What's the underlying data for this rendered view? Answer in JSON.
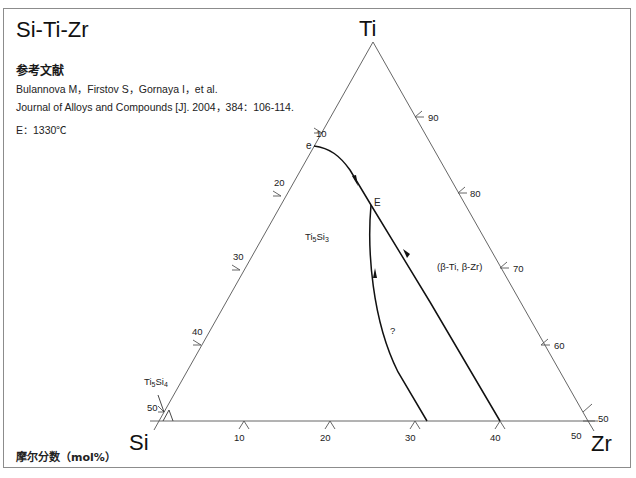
{
  "header": {
    "title": "Si-Ti-Zr",
    "reference_heading": "参考文献",
    "reference_authors": "Bulannova M，Firstov S，Gornaya I，et al.",
    "reference_journal": "Journal of Alloys and Compounds [J]. 2004，384：106-114.",
    "condition": "E：1330℃"
  },
  "footer": {
    "unit_label": "摩尔分数（mol%）"
  },
  "diagram": {
    "type": "partial-ternary-liquidus-projection",
    "corners": {
      "top": "Ti",
      "left": "Si",
      "right": "Zr"
    },
    "left_edge_ticks": [
      "10",
      "20",
      "30",
      "40",
      "50"
    ],
    "right_edge_ticks": [
      "90",
      "80",
      "70",
      "60",
      "50"
    ],
    "bottom_edge_ticks": [
      "10",
      "20",
      "30",
      "40",
      "50"
    ],
    "points": {
      "e": "e",
      "E": "E"
    },
    "regions": {
      "ti5si3": "Ti5Si3",
      "ti5si4": "Ti5Si4",
      "beta": "(β-Ti, β-Zr)",
      "unknown": "?"
    },
    "colors": {
      "frame": "#8c8c8c",
      "axis": "#555555",
      "curve": "#111111"
    }
  }
}
